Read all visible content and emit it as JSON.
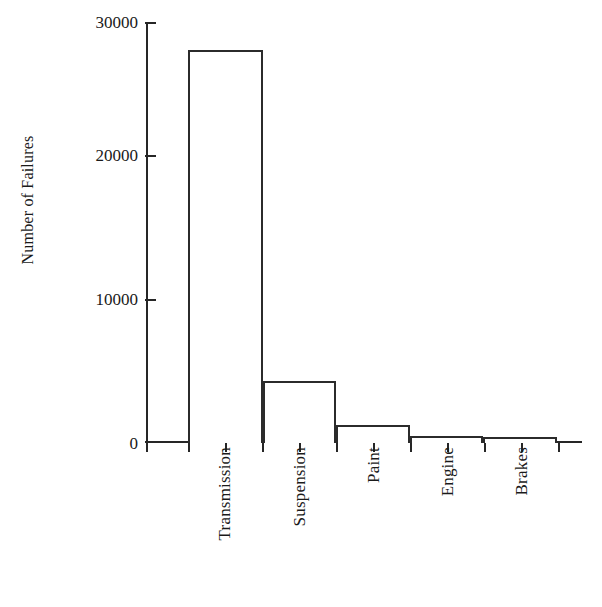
{
  "chart_data": {
    "type": "bar",
    "title": "",
    "subtitle": "",
    "xlabel": "",
    "ylabel": "Number of Failures",
    "categories": [
      "Transmission",
      "Suspension",
      "Paint",
      "Engine",
      "Brakes"
    ],
    "values": [
      28000,
      4450,
      1300,
      480,
      450
    ],
    "ylim": [
      0,
      30000
    ],
    "ytick_labels": [
      "0",
      "10000",
      "20000",
      "30000"
    ],
    "ytick_values": [
      0,
      10000,
      20000,
      30000
    ],
    "grid": false,
    "legend": false,
    "legend_position": "none",
    "bar_fill": "#ffffff",
    "bar_edge": "#2b2b2b",
    "axis_color": "#262626",
    "background": "#ffffff"
  },
  "axis": {
    "y_title": "Number of Failures"
  }
}
